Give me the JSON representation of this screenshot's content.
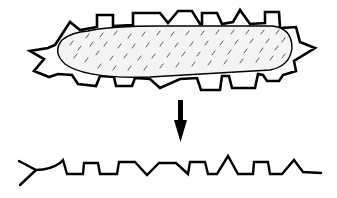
{
  "figure": {
    "colors": {
      "stroke": "#000000",
      "background": "#ffffff",
      "fill": "#f4f4f4"
    },
    "parts": [
      {
        "id": "organism",
        "label": ""
      },
      {
        "id": "arrow",
        "label": ""
      },
      {
        "id": "outline-trace",
        "label": ""
      }
    ]
  }
}
